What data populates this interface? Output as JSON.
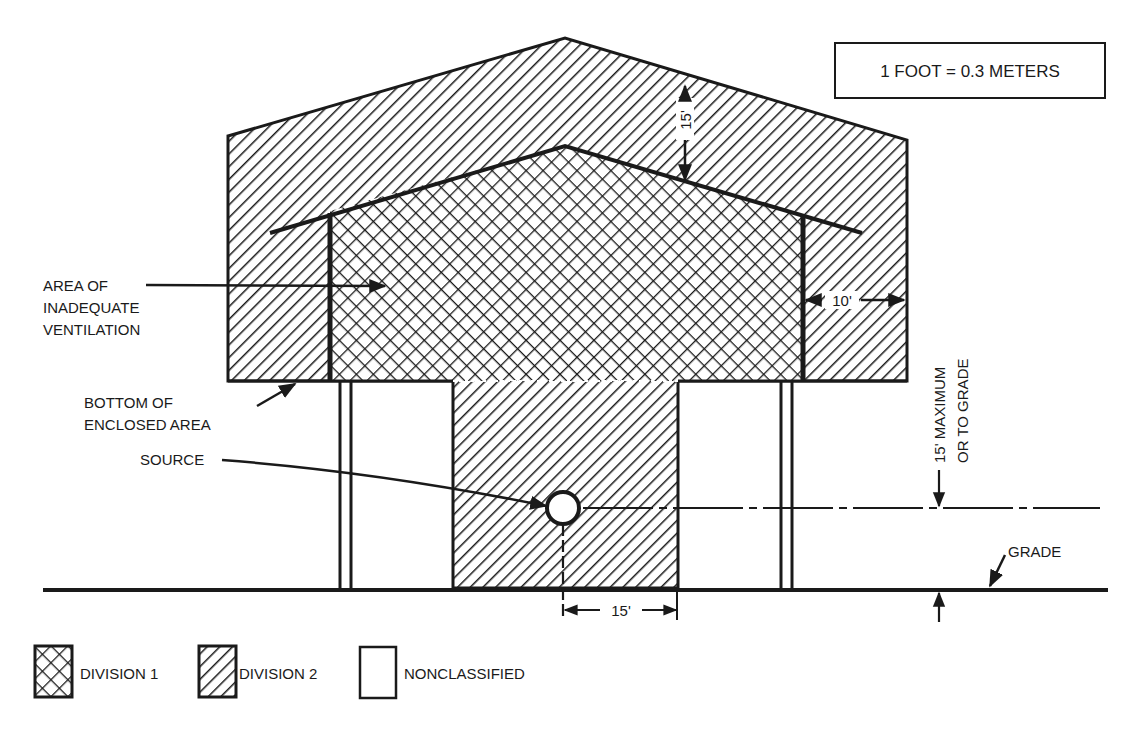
{
  "scale_note": "1 FOOT = 0.3 METERS",
  "labels": {
    "area_line1": "AREA OF",
    "area_line2": "INADEQUATE",
    "area_line3": "VENTILATION",
    "bottom_line1": "BOTTOM OF",
    "bottom_line2": "ENCLOSED AREA",
    "source": "SOURCE",
    "grade": "GRADE",
    "max_line1": "15' MAXIMUM",
    "max_line2": "OR TO GRADE"
  },
  "dimensions": {
    "roof_clearance": "15'",
    "side_clearance": "10'",
    "horizontal_from_source": "15'"
  },
  "legend": [
    {
      "key": "division1",
      "label": "DIVISION 1",
      "pattern": "crosshatch"
    },
    {
      "key": "division2",
      "label": "DIVISION 2",
      "pattern": "diagonal-hatch"
    },
    {
      "key": "nonclassified",
      "label": "NONCLASSIFIED",
      "pattern": "blank"
    }
  ],
  "colors": {
    "ink": "#1a1a1a",
    "paper": "#ffffff"
  }
}
